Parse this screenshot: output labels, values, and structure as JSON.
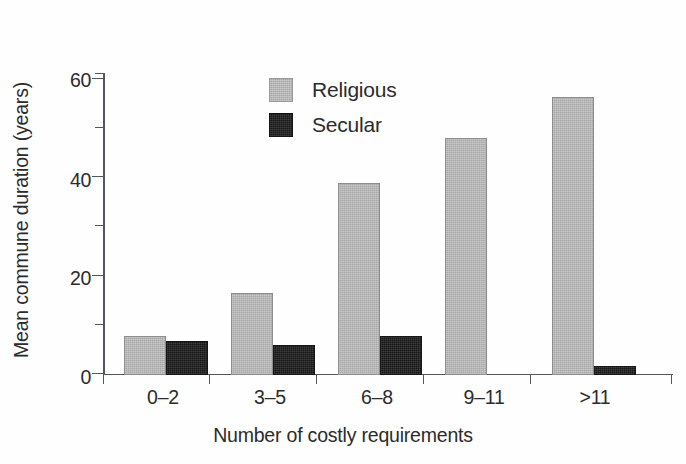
{
  "chart_data": {
    "type": "bar",
    "title": "",
    "subtitle": "",
    "xlabel": "Number of costly requirements",
    "ylabel": "Mean commune duration (years)",
    "categories": [
      "0–2",
      "3–5",
      "6–8",
      "9–11",
      ">11"
    ],
    "series": [
      {
        "name": "Religious",
        "color": "#b3b3b3",
        "values": [
          9,
          19,
          44.5,
          55,
          64.5
        ]
      },
      {
        "name": "Secular",
        "color": "#262626",
        "values": [
          8,
          7,
          9,
          0,
          2
        ]
      }
    ],
    "ylim": [
      0,
      72
    ],
    "yticks_major": [
      0,
      20,
      40,
      60
    ],
    "yticks_minor": [
      10,
      30,
      50,
      70
    ],
    "ytick_labels": [
      "0",
      "20",
      "40",
      "60"
    ],
    "grid": false,
    "legend_position": "upper-left-inside",
    "legend_entries": [
      "Religious",
      "Secular"
    ]
  },
  "axis": {
    "y_title": "Mean commune duration (years)",
    "x_title": "Number of costly requirements",
    "y_labels": {
      "t0": "0",
      "t20": "20",
      "t40": "40",
      "t60": "60"
    },
    "x_labels": {
      "c0": "0–2",
      "c1": "3–5",
      "c2": "6–8",
      "c3": "9–11",
      "c4": ">11"
    }
  },
  "legend": {
    "religious_label": "Religious",
    "secular_label": "Secular"
  },
  "colors": {
    "religious": "#b3b3b3",
    "secular": "#262626",
    "axis": "#53565a",
    "text": "#2b2b2b"
  }
}
